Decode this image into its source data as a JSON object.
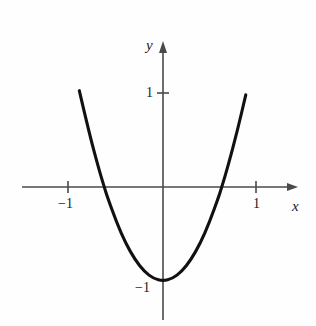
{
  "figure": {
    "background_color": "#fefefe",
    "ink_color": "#1a1a1a",
    "axis_color": "#4a4a4a",
    "curve_color": "#111111"
  },
  "labels": {
    "x_axis": "x",
    "y_axis": "y"
  },
  "ticks": {
    "x_neg1": "−1",
    "x_pos1": "1",
    "y_pos1": "1",
    "y_neg1": "−1"
  },
  "chart_data": {
    "type": "line",
    "title": "",
    "xlabel": "x",
    "ylabel": "y",
    "xlim": [
      -1.5,
      1.45
    ],
    "ylim": [
      -1.55,
      1.53
    ],
    "grid": false,
    "legend": null,
    "axes": {
      "origin_px": [
        163,
        187
      ],
      "x_unit_px": 93,
      "y_unit_px": 94,
      "x_axis_line_px": [
        22,
        298
      ],
      "y_axis_line_px": [
        43,
        320
      ],
      "x_arrow": "right",
      "y_arrow": "up"
    },
    "xticks": [
      -1,
      1
    ],
    "xticklabels": [
      "−1",
      "1"
    ],
    "yticks": [
      1,
      -1
    ],
    "yticklabels": [
      "1",
      "−1"
    ],
    "series": [
      {
        "name": "parabola",
        "equation": "y = 2.5x^2 - 1",
        "vertex": [
          0,
          -1
        ],
        "coefficient_a": 2.5,
        "x_intercepts": [
          -0.632,
          0.632
        ],
        "y_intercept": -1,
        "x_domain_drawn": [
          -0.9,
          0.89
        ],
        "x": [
          -0.9,
          -0.8,
          -0.7,
          -0.632,
          -0.6,
          -0.5,
          -0.4,
          -0.3,
          -0.2,
          -0.1,
          0,
          0.1,
          0.2,
          0.3,
          0.4,
          0.5,
          0.6,
          0.632,
          0.7,
          0.8,
          0.89
        ],
        "values": [
          1.025,
          0.6,
          0.225,
          0,
          -0.1,
          -0.375,
          -0.6,
          -0.775,
          -0.9,
          -0.975,
          -1,
          -0.975,
          -0.9,
          -0.775,
          -0.6,
          -0.375,
          -0.1,
          0,
          0.225,
          0.6,
          0.98
        ]
      }
    ]
  }
}
